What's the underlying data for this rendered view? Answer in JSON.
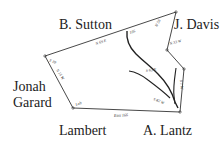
{
  "map": {
    "type": "hand-drawn property survey plat",
    "adjoining_owners": {
      "north": "B. Sutton",
      "northeast": "J. Davis",
      "west_line1": "Jonah",
      "west_line2": "Garard",
      "southwest": "Lambert",
      "southeast": "A. Lantz"
    },
    "boundary_notes": {
      "north_line": "N 69 E",
      "north_line_end": "105",
      "northeast_corner": "N 56",
      "east_upper": "N 33 W",
      "east_mid": "S 63 E",
      "west_corner": "S 10",
      "west_line": "N 15 W",
      "southwest_corner": "Lab",
      "south_line": "East 166",
      "southeast_line": "S 82 W",
      "east_lower": "S 1 W"
    },
    "colors": {
      "line": "#2a2a2a",
      "background": "#ffffff",
      "text": "#222222"
    }
  }
}
